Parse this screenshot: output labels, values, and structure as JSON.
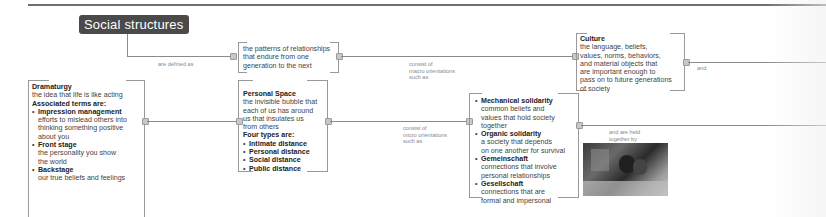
{
  "diagram": {
    "title": "Social structures",
    "nodes": {
      "definition": {
        "text_lines": [
          "the patterns of relationships",
          "that endure from one",
          "generation to the next"
        ]
      },
      "culture": {
        "heading": "Culture",
        "text_lines": [
          "the language, beliefs,",
          "values, norms, behaviors,",
          "and material objects that",
          "are important enough to",
          "pass on to future generations",
          "of society"
        ]
      },
      "dramaturgy": {
        "heading": "Dramaturgy",
        "desc": "the idea that life is like acting",
        "subheading": "Associated terms are:",
        "items": [
          {
            "term": "Impression management",
            "desc_lines": [
              "efforts to mislead others into",
              "thinking something positive",
              "about you"
            ]
          },
          {
            "term": "Front stage",
            "desc_lines": [
              "the personality you show",
              "the world"
            ]
          },
          {
            "term": "Backstage",
            "desc_lines": [
              "our true beliefs and feelings"
            ]
          }
        ]
      },
      "personal_space": {
        "heading": "Personal Space",
        "desc_lines": [
          "the invisible bubble that",
          "each of us has around",
          "us that insulates us",
          "from others"
        ],
        "subheading": "Four types are:",
        "items": [
          "Intimate distance",
          "Personal distance",
          "Social distance",
          "Public distance"
        ]
      },
      "solidarity": {
        "items": [
          {
            "term": "Mechanical solidarity",
            "desc_lines": [
              "common beliefs and",
              "values that hold society",
              "together"
            ]
          },
          {
            "term": "Organic solidarity",
            "desc_lines": [
              "a society that depends",
              "on one another for survival"
            ]
          },
          {
            "term": "Gemeinschaft",
            "desc_lines": [
              "connections that involve",
              "personal relationships"
            ]
          },
          {
            "term": "Gesellschaft",
            "desc_lines": [
              "connections that are",
              "formal and impersonal"
            ]
          }
        ]
      }
    },
    "connector_labels": {
      "defined_as": "are defined as",
      "macro": [
        "consist of",
        "macro orientations",
        "such as"
      ],
      "micro": [
        "consist of",
        "micro orientations",
        "such as"
      ],
      "and": "and",
      "held_together": [
        "and are held",
        "together by"
      ]
    },
    "photo": {
      "alt": "students-working-together-photo"
    }
  },
  "colors": {
    "title_bg": "#4a4a4a",
    "title_text": "#ffffff",
    "line": "#8a8a8a",
    "text": "#444444",
    "label": "#888888"
  }
}
